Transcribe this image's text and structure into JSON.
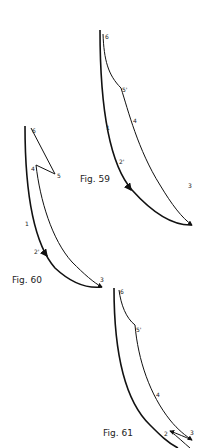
{
  "figures": [
    {
      "caption": "Fig. 59",
      "points": {
        "p1": "1",
        "p2": "2'",
        "p3": "3",
        "p4": "4",
        "p5": "5'",
        "p6": "6"
      }
    },
    {
      "caption": "Fig. 60",
      "points": {
        "p1": "1",
        "p2": "2'",
        "p3": "3",
        "p4": "4",
        "p5": "5",
        "p6": "6"
      }
    },
    {
      "caption": "Fig. 61",
      "points": {
        "p2": "2",
        "p3": "3",
        "p4": "4",
        "p5": "5'",
        "p6": "6"
      }
    }
  ]
}
